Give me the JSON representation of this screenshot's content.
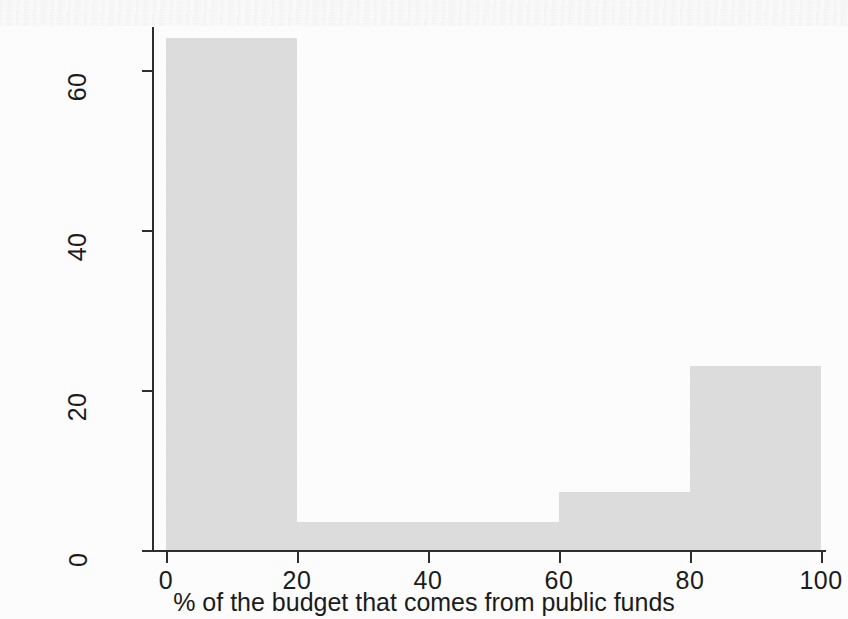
{
  "chart_data": {
    "type": "bar",
    "title": "",
    "subtitle": "",
    "xlabel": "% of the budget that comes from public funds",
    "ylabel": "Percentage of associations",
    "xlim": [
      0,
      100
    ],
    "ylim": [
      0,
      66
    ],
    "grid": false,
    "legend": null,
    "x_ticks": [
      "0",
      "20",
      "40",
      "60",
      "80",
      "100"
    ],
    "x_tick_values": [
      0,
      20,
      40,
      60,
      80,
      100
    ],
    "y_ticks": [
      "0",
      "20",
      "40",
      "60"
    ],
    "y_tick_values": [
      0,
      20,
      40,
      60
    ],
    "bar_color": "#dedede",
    "axis_color": "#2e2e2e",
    "background_color": "#ffffff",
    "categories": [
      "0-20",
      "20-60",
      "60-80",
      "80-100"
    ],
    "values": [
      64,
      3.5,
      7.2,
      23
    ],
    "bins": [
      {
        "label": "0-20",
        "x_start": 0,
        "x_end": 20,
        "value": 64
      },
      {
        "label": "20-60",
        "x_start": 20,
        "x_end": 60,
        "value": 3.5
      },
      {
        "label": "60-80",
        "x_start": 60,
        "x_end": 80,
        "value": 7.2
      },
      {
        "label": "80-100",
        "x_start": 80,
        "x_end": 100,
        "value": 23
      }
    ]
  }
}
